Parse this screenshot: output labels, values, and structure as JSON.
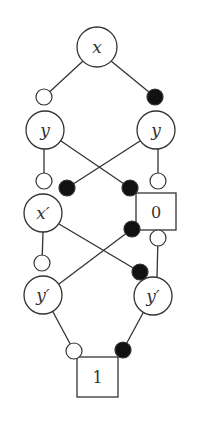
{
  "diagram": {
    "type": "decision-diagram",
    "colors": {
      "stroke": "#333333",
      "fill_dot": "#111111",
      "background": "#ffffff"
    },
    "nodes": [
      {
        "id": "x",
        "label": "x",
        "shape": "circle",
        "cx": 97,
        "cy": 47,
        "r": 20
      },
      {
        "id": "yL",
        "label": "y",
        "shape": "circle",
        "cx": 45,
        "cy": 130,
        "r": 19
      },
      {
        "id": "yR",
        "label": "y",
        "shape": "circle",
        "cx": 156,
        "cy": 130,
        "r": 19
      },
      {
        "id": "xp",
        "label": "x′",
        "shape": "circle",
        "cx": 43,
        "cy": 213,
        "r": 19
      },
      {
        "id": "t0",
        "label": "0",
        "shape": "box",
        "x": 136,
        "y": 193,
        "w": 40,
        "h": 37
      },
      {
        "id": "ypL",
        "label": "y′",
        "shape": "circle",
        "cx": 43,
        "cy": 295,
        "r": 19
      },
      {
        "id": "ypR",
        "label": "y′",
        "shape": "circle",
        "cx": 153,
        "cy": 296,
        "r": 19
      },
      {
        "id": "t1",
        "label": "1",
        "shape": "box",
        "x": 77,
        "y": 357,
        "w": 41,
        "h": 40
      }
    ],
    "edges": [
      {
        "from": "x",
        "to": "yL",
        "x1": 83,
        "y1": 61,
        "x2": 44,
        "y2": 97,
        "marker": "open",
        "mx": 44,
        "my": 97
      },
      {
        "from": "x",
        "to": "yR",
        "x1": 111,
        "y1": 61,
        "x2": 155,
        "y2": 97,
        "marker": "filled",
        "mx": 155,
        "my": 97
      },
      {
        "from": "yL",
        "to": "xp",
        "x1": 44,
        "y1": 149,
        "x2": 44,
        "y2": 181,
        "marker": "open",
        "mx": 44,
        "my": 181
      },
      {
        "from": "yL",
        "to": "t0",
        "x1": 61,
        "y1": 141,
        "x2": 130,
        "y2": 188,
        "marker": "filled",
        "mx": 130,
        "my": 188
      },
      {
        "from": "yR",
        "to": "xp",
        "x1": 140,
        "y1": 141,
        "x2": 67,
        "y2": 188,
        "marker": "filled",
        "mx": 67,
        "my": 188
      },
      {
        "from": "yR",
        "to": "t0",
        "x1": 158,
        "y1": 149,
        "x2": 158,
        "y2": 181,
        "marker": "open",
        "mx": 158,
        "my": 181
      },
      {
        "from": "xp",
        "to": "ypL",
        "x1": 43,
        "y1": 232,
        "x2": 42,
        "y2": 263,
        "marker": "open",
        "mx": 42,
        "my": 263
      },
      {
        "from": "xp",
        "to": "ypR",
        "x1": 59,
        "y1": 224,
        "x2": 140,
        "y2": 272,
        "marker": "filled",
        "mx": 140,
        "my": 272
      },
      {
        "from": "ypL",
        "to": "t0",
        "x1": 59,
        "y1": 284,
        "x2": 132,
        "y2": 229,
        "marker": "filled",
        "mx": 132,
        "my": 229
      },
      {
        "from": "ypR",
        "to": "t0",
        "x1": 157,
        "y1": 277,
        "x2": 158,
        "y2": 238,
        "marker": "open",
        "mx": 158,
        "my": 238
      },
      {
        "from": "ypL",
        "to": "t1",
        "x1": 53,
        "y1": 312,
        "x2": 74,
        "y2": 351,
        "marker": "open",
        "mx": 74,
        "my": 351
      },
      {
        "from": "ypR",
        "to": "t1",
        "x1": 143,
        "y1": 313,
        "x2": 123,
        "y2": 350,
        "marker": "filled",
        "mx": 123,
        "my": 350
      }
    ],
    "marker_radius": 8
  }
}
